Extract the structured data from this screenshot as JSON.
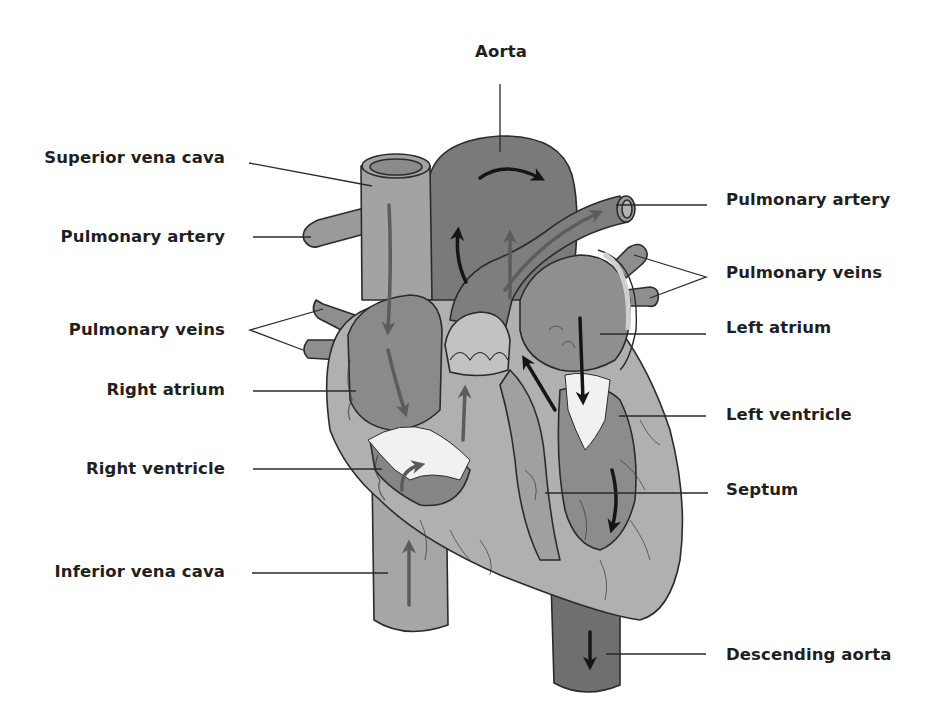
{
  "diagram": {
    "type": "anatomical-labeled-illustration",
    "colors": {
      "background": "#ffffff",
      "label_text": "#1f1f1f",
      "leader_line": "#2a2a2a",
      "vessel_light": "#a9a9a9",
      "vessel_mid": "#8c8c8c",
      "vessel_dark": "#6e6e6e",
      "muscle_light": "#b4b4b4",
      "chamber_mid": "#8a8a8a",
      "valve_white": "#f2f2f2",
      "outline": "#2b2b2b",
      "arrow_dark": "#151515",
      "arrow_grey": "#5c5c5c"
    }
  },
  "labels": {
    "aorta": "Aorta",
    "superior_vena_cava": "Superior vena cava",
    "pulmonary_artery_left": "Pulmonary artery",
    "pulmonary_veins_left": "Pulmonary veins",
    "right_atrium": "Right atrium",
    "right_ventricle": "Right ventricle",
    "inferior_vena_cava": "Inferior vena cava",
    "pulmonary_artery_right": "Pulmonary artery",
    "pulmonary_veins_right": "Pulmonary veins",
    "left_atrium": "Left atrium",
    "left_ventricle": "Left ventricle",
    "septum": "Septum",
    "descending_aorta": "Descending aorta"
  }
}
